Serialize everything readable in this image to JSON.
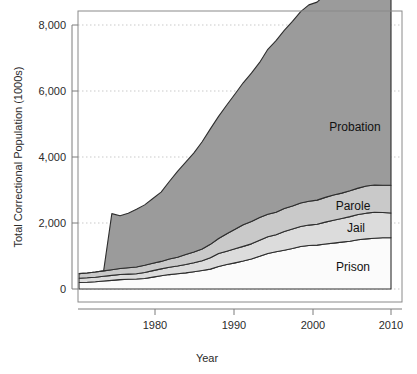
{
  "chart_data": {
    "type": "area",
    "title": "",
    "subtitle": "",
    "xlabel": "Year",
    "ylabel": "Total Correctional Population (1000s)",
    "stacked": true,
    "grid": true,
    "legend_position": "inline-annotations",
    "xlim": [
      1972,
      2010
    ],
    "ylim": [
      0,
      8000
    ],
    "xticks": [
      1980,
      1990,
      2000,
      2010
    ],
    "xtick_labels": [
      "1980",
      "1990",
      "2000",
      "2010"
    ],
    "yticks": [
      0,
      2000,
      4000,
      6000,
      8000
    ],
    "ytick_labels": [
      "0",
      "2,000",
      "4,000",
      "6,000",
      "8,000"
    ],
    "x": [
      1972,
      1973,
      1974,
      1975,
      1976,
      1977,
      1978,
      1979,
      1980,
      1981,
      1982,
      1983,
      1984,
      1985,
      1986,
      1987,
      1988,
      1989,
      1990,
      1991,
      1992,
      1993,
      1994,
      1995,
      1996,
      1997,
      1998,
      1999,
      2000,
      2001,
      2002,
      2003,
      2004,
      2005,
      2006,
      2007,
      2008,
      2009,
      2010
    ],
    "series": [
      {
        "name": "Prison",
        "color": "#fbfbfb",
        "values": [
          196,
          204,
          218,
          241,
          262,
          285,
          294,
          301,
          316,
          360,
          402,
          437,
          464,
          488,
          523,
          561,
          603,
          680,
          740,
          792,
          847,
          909,
          990,
          1078,
          1128,
          1176,
          1225,
          1287,
          1316,
          1330,
          1362,
          1390,
          1421,
          1446,
          1492,
          1518,
          1540,
          1553,
          1552
        ]
      },
      {
        "name": "Jail",
        "color": "#dcdcdc",
        "values": [
          130,
          135,
          140,
          145,
          150,
          155,
          158,
          160,
          183,
          196,
          209,
          223,
          234,
          256,
          274,
          295,
          343,
          395,
          405,
          426,
          444,
          459,
          486,
          507,
          518,
          567,
          592,
          605,
          621,
          631,
          665,
          691,
          714,
          747,
          766,
          780,
          785,
          767,
          749
        ]
      },
      {
        "name": "Parole",
        "color": "#c9c9c9",
        "values": [
          140,
          148,
          156,
          164,
          172,
          182,
          192,
          204,
          220,
          225,
          225,
          247,
          266,
          300,
          327,
          355,
          407,
          456,
          531,
          590,
          658,
          676,
          690,
          679,
          679,
          694,
          696,
          714,
          723,
          732,
          750,
          769,
          771,
          784,
          799,
          821,
          828,
          824,
          841
        ]
      },
      {
        "name": "Probation",
        "color": "#9b9b9b",
        "values": [
          0,
          0,
          0,
          0,
          1700,
          1600,
          1650,
          1750,
          1830,
          1960,
          2100,
          2350,
          2600,
          2800,
          3000,
          3250,
          3500,
          3700,
          3900,
          4100,
          4300,
          4500,
          4700,
          5000,
          5200,
          5400,
          5600,
          5800,
          5950,
          6000,
          6150,
          6350,
          6500,
          6650,
          6800,
          7000,
          7050,
          6900,
          6850
        ]
      }
    ],
    "annotations": [
      {
        "text": "Probation",
        "x": 2002.5,
        "y": 4600
      },
      {
        "text": "Parole",
        "x": 2002.0,
        "y": 2500
      },
      {
        "text": "Jail",
        "x": 2002.5,
        "y": 1850
      },
      {
        "text": "Prison",
        "x": 2002.0,
        "y": 800
      }
    ],
    "stack_top_prison": [
      196,
      204,
      218,
      241,
      262,
      285,
      294,
      301,
      316,
      360,
      402,
      437,
      464,
      488,
      523,
      561,
      603,
      680,
      740,
      792,
      847,
      909,
      990,
      1078,
      1128,
      1176,
      1225,
      1287,
      1316,
      1330,
      1362,
      1390,
      1421,
      1446,
      1492,
      1518,
      1540,
      1553,
      1552
    ],
    "stack_top_jail": [
      326,
      339,
      358,
      386,
      412,
      440,
      452,
      461,
      499,
      556,
      611,
      660,
      698,
      744,
      797,
      856,
      946,
      1075,
      1145,
      1218,
      1291,
      1368,
      1476,
      1585,
      1646,
      1743,
      1817,
      1892,
      1937,
      1961,
      2027,
      2081,
      2135,
      2193,
      2258,
      2298,
      2325,
      2320,
      2301
    ],
    "stack_top_parole": [
      466,
      487,
      514,
      550,
      584,
      622,
      644,
      665,
      719,
      781,
      836,
      907,
      964,
      1044,
      1124,
      1211,
      1353,
      1531,
      1676,
      1808,
      1949,
      2044,
      2166,
      2264,
      2325,
      2437,
      2513,
      2606,
      2660,
      2693,
      2777,
      2850,
      2906,
      2977,
      3057,
      3119,
      3153,
      3144,
      3142
    ],
    "stack_top_probation": [
      466,
      487,
      514,
      550,
      2284,
      2222,
      2294,
      2415,
      2549,
      2741,
      2936,
      3257,
      3564,
      3844,
      4124,
      4461,
      4853,
      5231,
      5576,
      5908,
      6249,
      6544,
      6866,
      7264,
      7525,
      7837,
      8113,
      8406,
      8610,
      8693,
      8927,
      9200,
      9406,
      9627,
      9857,
      10119,
      10203,
      10044,
      9992
    ]
  },
  "rendered": {
    "ylabel": "Total Correctional Population (1000s)",
    "xlabel": "Year",
    "ytick_labels": [
      "8,000",
      "6,000",
      "4,000",
      "2,000",
      "0"
    ],
    "xtick_labels": [
      "1980",
      "1990",
      "2000",
      "2010"
    ],
    "label_probation": "Probation",
    "label_parole": "Parole",
    "label_jail": "Jail",
    "label_prison": "Prison"
  }
}
